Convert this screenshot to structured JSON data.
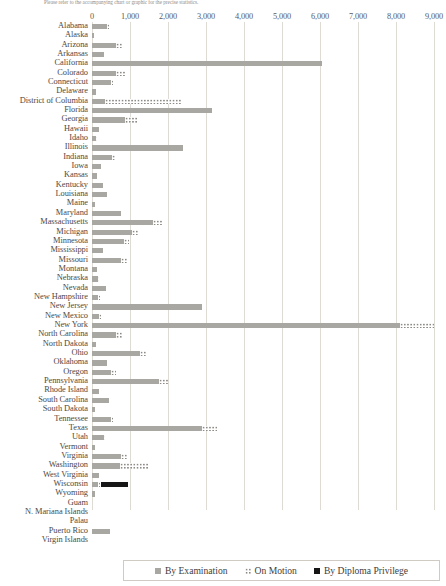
{
  "caption": "Please refer to the accompanying chart or graphic for the precise statistics.",
  "legend": {
    "items": [
      {
        "label": "By Examination",
        "key": "exam",
        "color": "#a9a7a2"
      },
      {
        "label": "On Motion",
        "key": "motion",
        "color": "#8e8b86"
      },
      {
        "label": "By Diploma Privilege",
        "key": "diploma",
        "color": "#161616"
      }
    ]
  },
  "chart_data": {
    "type": "bar",
    "orientation": "horizontal",
    "stacked": true,
    "title": "",
    "xlabel": "",
    "ylabel": "",
    "xlim": [
      0,
      9000
    ],
    "grid": true,
    "legend_position": "bottom",
    "xticks": [
      0,
      1000,
      2000,
      3000,
      4000,
      5000,
      6000,
      7000,
      8000,
      9000
    ],
    "xticklabels": [
      "0",
      "1,000",
      "2,000",
      "3,000",
      "4,000",
      "5,000",
      "6,000",
      "7,000",
      "8,000",
      "9,000"
    ],
    "categories": [
      "Alabama",
      "Alaska",
      "Arizona",
      "Arkansas",
      "California",
      "Colorado",
      "Connecticut",
      "Delaware",
      "District of Columbia",
      "Florida",
      "Georgia",
      "Hawaii",
      "Idaho",
      "Illinois",
      "Indiana",
      "Iowa",
      "Kansas",
      "Kentucky",
      "Louisiana",
      "Maine",
      "Maryland",
      "Massachusetts",
      "Michigan",
      "Minnesota",
      "Mississippi",
      "Missouri",
      "Montana",
      "Nebraska",
      "Nevada",
      "New Hampshire",
      "New Jersey",
      "New Mexico",
      "New York",
      "North Carolina",
      "North Dakota",
      "Ohio",
      "Oklahoma",
      "Oregon",
      "Pennsylvania",
      "Rhode Island",
      "South Carolina",
      "South Dakota",
      "Tennessee",
      "Texas",
      "Utah",
      "Vermont",
      "Virginia",
      "Washington",
      "West Virginia",
      "Wisconsin",
      "Wyoming",
      "Guam",
      "N. Mariana Islands",
      "Palau",
      "Puerto Rico",
      "Virgin Islands"
    ],
    "series": [
      {
        "name": "By Examination",
        "key": "exam",
        "color": "#a9a7a2",
        "values": [
          400,
          60,
          620,
          320,
          6050,
          620,
          490,
          110,
          350,
          3150,
          860,
          180,
          100,
          2400,
          520,
          230,
          130,
          290,
          390,
          80,
          760,
          1600,
          1050,
          850,
          300,
          760,
          120,
          150,
          360,
          150,
          2900,
          180,
          8100,
          640,
          100,
          1250,
          400,
          500,
          1750,
          180,
          450,
          90,
          500,
          2900,
          310,
          70,
          750,
          740,
          180,
          160,
          90,
          0,
          0,
          0,
          470,
          0
        ]
      },
      {
        "name": "On Motion",
        "key": "motion",
        "color": "#8e8b86",
        "values": [
          60,
          0,
          170,
          0,
          0,
          260,
          80,
          0,
          2000,
          0,
          360,
          0,
          40,
          0,
          120,
          0,
          0,
          0,
          0,
          0,
          0,
          230,
          190,
          130,
          0,
          180,
          0,
          40,
          0,
          80,
          0,
          50,
          900,
          170,
          0,
          210,
          0,
          120,
          260,
          0,
          0,
          0,
          70,
          400,
          40,
          0,
          180,
          760,
          0,
          80,
          0,
          0,
          0,
          0,
          0,
          0
        ]
      },
      {
        "name": "By Diploma Privilege",
        "key": "diploma",
        "color": "#161616",
        "values": [
          0,
          0,
          0,
          0,
          0,
          0,
          0,
          0,
          0,
          0,
          0,
          0,
          0,
          0,
          0,
          0,
          0,
          0,
          0,
          0,
          0,
          0,
          0,
          0,
          0,
          0,
          0,
          0,
          0,
          0,
          0,
          0,
          0,
          0,
          0,
          0,
          0,
          0,
          0,
          0,
          0,
          0,
          0,
          0,
          0,
          0,
          0,
          0,
          0,
          720,
          0,
          0,
          0,
          0,
          0,
          0
        ]
      }
    ]
  }
}
